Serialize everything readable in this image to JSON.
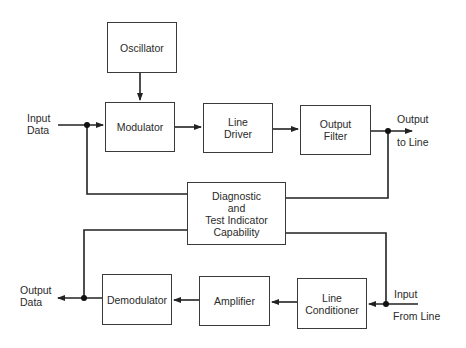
{
  "diagram": {
    "type": "block-diagram",
    "blocks": {
      "oscillator": "Oscillator",
      "modulator": "Modulator",
      "line_driver_1": "Line",
      "line_driver_2": "Driver",
      "output_filter_1": "Output",
      "output_filter_2": "Filter",
      "diagnostic_1": "Diagnostic",
      "diagnostic_2": "and",
      "diagnostic_3": "Test Indicator",
      "diagnostic_4": "Capability",
      "demodulator": "Demodulator",
      "amplifier": "Amplifier",
      "line_conditioner_1": "Line",
      "line_conditioner_2": "Conditioner"
    },
    "labels": {
      "input_data_1": "Input",
      "input_data_2": "Data",
      "output_to_line_1": "Output",
      "output_to_line_2": "to Line",
      "output_data_1": "Output",
      "output_data_2": "Data",
      "input_from_line_1": "Input",
      "input_from_line_2": "From Line"
    },
    "connections": [
      {
        "from": "Oscillator",
        "to": "Modulator"
      },
      {
        "from": "Input Data",
        "to": "Modulator"
      },
      {
        "from": "Modulator",
        "to": "Line Driver"
      },
      {
        "from": "Line Driver",
        "to": "Output Filter"
      },
      {
        "from": "Output Filter",
        "to": "Output to Line"
      },
      {
        "from": "Input Data junction",
        "to": "Diagnostic and Test Indicator Capability"
      },
      {
        "from": "Output to Line junction",
        "to": "Diagnostic and Test Indicator Capability"
      },
      {
        "from": "Diagnostic and Test Indicator Capability",
        "to": "Output Data junction"
      },
      {
        "from": "Diagnostic and Test Indicator Capability",
        "to": "Input From Line junction"
      },
      {
        "from": "Input From Line",
        "to": "Line Conditioner"
      },
      {
        "from": "Line Conditioner",
        "to": "Amplifier"
      },
      {
        "from": "Amplifier",
        "to": "Demodulator"
      },
      {
        "from": "Demodulator",
        "to": "Output Data"
      }
    ]
  }
}
